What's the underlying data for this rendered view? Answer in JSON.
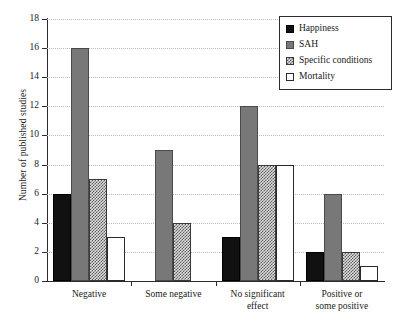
{
  "chart_data": {
    "type": "bar",
    "title": "",
    "xlabel": "",
    "ylabel": "Number of published studies",
    "ylim": [
      0,
      18
    ],
    "ytick_labels": [
      "0",
      "2",
      "4",
      "6",
      "8",
      "10",
      "12",
      "14",
      "16",
      "18"
    ],
    "ytick_values": [
      0,
      2,
      4,
      6,
      8,
      10,
      12,
      14,
      16,
      18
    ],
    "grid": true,
    "grid_style": "dotted-horizontal",
    "legend_position": "top-right",
    "categories": [
      "Negative",
      "Some negative",
      "No significant effect",
      "Positive or some positive"
    ],
    "category_lines": [
      [
        "Negative"
      ],
      [
        "Some negative"
      ],
      [
        "No significant",
        "effect"
      ],
      [
        "Positive or",
        "some positive"
      ]
    ],
    "series": [
      {
        "name": "Happiness",
        "values": [
          6,
          0,
          3,
          2
        ],
        "fill": "solid-black",
        "color": "#111111"
      },
      {
        "name": "SAH",
        "values": [
          16,
          9,
          12,
          6
        ],
        "fill": "solid-gray",
        "color": "#787878"
      },
      {
        "name": "Specific conditions",
        "values": [
          7,
          4,
          8,
          2
        ],
        "fill": "checkered",
        "color": "#dedede"
      },
      {
        "name": "Mortality",
        "values": [
          3,
          0,
          8,
          1
        ],
        "fill": "solid-white",
        "color": "#ffffff"
      }
    ]
  }
}
